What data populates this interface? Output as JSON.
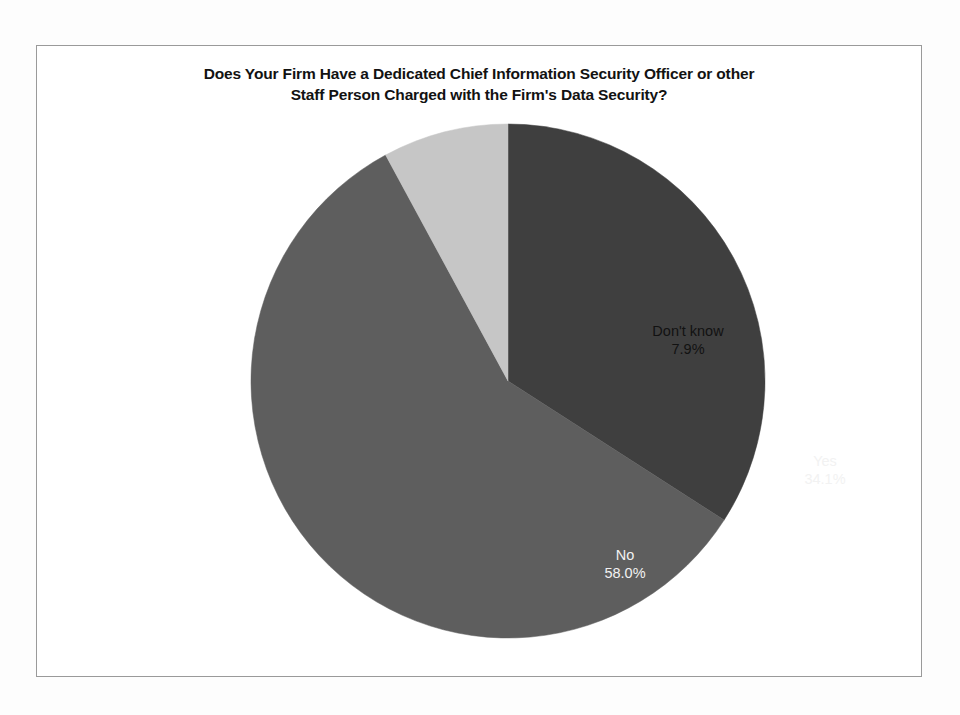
{
  "figure": {
    "title_line1": "Does Your Firm Have a Dedicated Chief Information Security Officer or other",
    "title_line2": "Staff Person Charged with the Firm's Data Security?"
  },
  "chart_data": {
    "type": "pie",
    "title": "Does Your Firm Have a Dedicated Chief Information Security Officer or other Staff Person Charged with the Firm's Data Security?",
    "xlabel": "",
    "ylabel": "",
    "legend_position": "none",
    "grid": false,
    "start_angle_deg": 0,
    "direction": "clockwise",
    "categories": [
      "Yes",
      "No",
      "Don't know"
    ],
    "values": [
      34.1,
      58.0,
      7.9
    ],
    "value_labels": [
      "34.1%",
      "58.0%",
      "7.9%"
    ],
    "colors": [
      "#3f3f3f",
      "#5e5e5e",
      "#c6c6c6"
    ],
    "label_text_colors": [
      "#f2f2f2",
      "#f2f2f2",
      "#121212"
    ],
    "slices": [
      {
        "name": "Yes",
        "value": 34.1,
        "label": "Yes",
        "value_label": "34.1%",
        "color": "#3f3f3f"
      },
      {
        "name": "No",
        "value": 58.0,
        "label": "No",
        "value_label": "58.0%",
        "color": "#5e5e5e"
      },
      {
        "name": "Don't know",
        "value": 7.9,
        "label": "Don't know",
        "value_label": "7.9%",
        "color": "#c6c6c6"
      }
    ]
  }
}
